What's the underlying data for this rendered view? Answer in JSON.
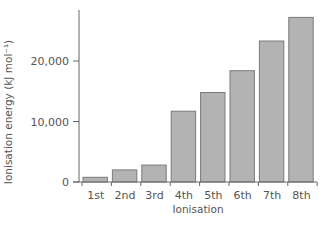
{
  "chart_data": {
    "type": "bar",
    "title": "",
    "xlabel": "Ionisation",
    "ylabel": "Ionisation energy (kJ mol⁻¹)",
    "categories": [
      "1st",
      "2nd",
      "3rd",
      "4th",
      "5th",
      "6th",
      "7th",
      "8th"
    ],
    "values": [
      780,
      2000,
      2800,
      11700,
      14800,
      18400,
      23300,
      27200
    ],
    "ylim": [
      0,
      28500
    ],
    "yticks": [
      0,
      10000,
      20000
    ],
    "ytick_labels": [
      "0",
      "10,000",
      "20,000"
    ],
    "grid": false,
    "legend": null,
    "colors": {
      "bar_fill": "#b3b3b3",
      "bar_stroke": "#7a7a7a",
      "axis": "#666666",
      "text": "#555555"
    }
  }
}
